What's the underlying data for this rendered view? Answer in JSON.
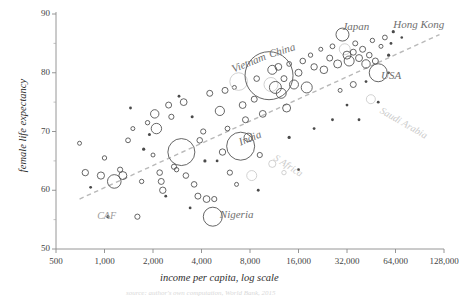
{
  "chart_data": {
    "type": "scatter",
    "title": "",
    "xlabel": "income per capita, log scale",
    "ylabel": "female life expectancy",
    "xticklabels": [
      "500",
      "1,000",
      "2,000",
      "4,000",
      "8,000",
      "16,000",
      "32,000",
      "64,000",
      "128,000"
    ],
    "xtickvalues": [
      500,
      1000,
      2000,
      4000,
      8000,
      16000,
      32000,
      64000,
      128000
    ],
    "yticklabels": [
      "50",
      "60",
      "70",
      "80",
      "90"
    ],
    "ytickvalues": [
      50,
      60,
      70,
      80,
      90
    ],
    "xlim": [
      500,
      128000
    ],
    "ylim": [
      50,
      90
    ],
    "xscale": "log",
    "grid": false,
    "legend": "none",
    "bubble_encoding": "bubble area encodes population; bubble radius varies",
    "trendline": {
      "style": "dashed",
      "color": "#b9b9b9",
      "x_start": 700,
      "y_start": 58.5,
      "x_end": 120000,
      "y_end": 86.5
    },
    "annotations": [
      {
        "label": "Vietnam",
        "x": 6200,
        "y": 80.5,
        "rotation": -22
      },
      {
        "label": "China",
        "x": 10500,
        "y": 83.0,
        "rotation": -17
      },
      {
        "label": "Japan",
        "x": 30000,
        "y": 87.8,
        "rotation": 0
      },
      {
        "label": "Hong Kong",
        "x": 62000,
        "y": 88.2,
        "rotation": 0
      },
      {
        "label": "USA",
        "x": 52000,
        "y": 79.5,
        "rotation": 0
      },
      {
        "label": "Saudi Arabia",
        "x": 52000,
        "y": 73.5,
        "rotation": 30
      },
      {
        "label": "India",
        "x": 6800,
        "y": 68.0,
        "rotation": -22
      },
      {
        "label": "S Africa",
        "x": 11500,
        "y": 65.5,
        "rotation": 33
      },
      {
        "label": "Nigeria",
        "x": 5200,
        "y": 55.8,
        "rotation": 0
      },
      {
        "label": "CAF",
        "x": 900,
        "y": 55.5,
        "rotation": 0
      }
    ],
    "points": [
      {
        "x": 760,
        "y": 63.0,
        "r": 3.2,
        "c": "dark"
      },
      {
        "x": 700,
        "y": 68.0,
        "r": 2.0,
        "c": "dark"
      },
      {
        "x": 820,
        "y": 60.5,
        "r": 1.4,
        "c": "dark"
      },
      {
        "x": 950,
        "y": 62.5,
        "r": 3.6,
        "c": "dark"
      },
      {
        "x": 1000,
        "y": 65.5,
        "r": 2.2,
        "c": "dark"
      },
      {
        "x": 1050,
        "y": 55.5,
        "r": 1.6,
        "c": "dark"
      },
      {
        "x": 1150,
        "y": 61.5,
        "r": 6.8,
        "c": "dark"
      },
      {
        "x": 1300,
        "y": 62.5,
        "r": 4.0,
        "c": "dark"
      },
      {
        "x": 1250,
        "y": 63.5,
        "r": 2.6,
        "c": "dark"
      },
      {
        "x": 1400,
        "y": 68.5,
        "r": 2.4,
        "c": "dark"
      },
      {
        "x": 1500,
        "y": 70.5,
        "r": 2.0,
        "c": "dark"
      },
      {
        "x": 1600,
        "y": 55.5,
        "r": 2.6,
        "c": "dark"
      },
      {
        "x": 1700,
        "y": 61.5,
        "r": 2.2,
        "c": "dark"
      },
      {
        "x": 1750,
        "y": 67.0,
        "r": 1.6,
        "c": "dark"
      },
      {
        "x": 1850,
        "y": 71.5,
        "r": 2.2,
        "c": "dark"
      },
      {
        "x": 1900,
        "y": 69.5,
        "r": 1.5,
        "c": "dark"
      },
      {
        "x": 2050,
        "y": 73.0,
        "r": 4.2,
        "c": "dark"
      },
      {
        "x": 2100,
        "y": 70.5,
        "r": 5.2,
        "c": "dark"
      },
      {
        "x": 2200,
        "y": 63.0,
        "r": 2.8,
        "c": "dark"
      },
      {
        "x": 2250,
        "y": 61.5,
        "r": 3.0,
        "c": "dark"
      },
      {
        "x": 2300,
        "y": 60.0,
        "r": 3.2,
        "c": "dark"
      },
      {
        "x": 2400,
        "y": 59.0,
        "r": 1.4,
        "c": "dark"
      },
      {
        "x": 2500,
        "y": 74.5,
        "r": 3.0,
        "c": "dark"
      },
      {
        "x": 2600,
        "y": 72.5,
        "r": 2.6,
        "c": "dark"
      },
      {
        "x": 2700,
        "y": 64.0,
        "r": 2.6,
        "c": "dark"
      },
      {
        "x": 2800,
        "y": 63.5,
        "r": 2.2,
        "c": "dark"
      },
      {
        "x": 3000,
        "y": 66.5,
        "r": 13.5,
        "c": "dark"
      },
      {
        "x": 3100,
        "y": 75.0,
        "r": 3.4,
        "c": "dark"
      },
      {
        "x": 3200,
        "y": 62.5,
        "r": 2.8,
        "c": "dark"
      },
      {
        "x": 3400,
        "y": 57.0,
        "r": 1.4,
        "c": "dark"
      },
      {
        "x": 3600,
        "y": 61.0,
        "r": 2.8,
        "c": "dark"
      },
      {
        "x": 3800,
        "y": 59.0,
        "r": 3.0,
        "c": "dark"
      },
      {
        "x": 3900,
        "y": 68.5,
        "r": 2.8,
        "c": "dark"
      },
      {
        "x": 4100,
        "y": 70.0,
        "r": 2.6,
        "c": "dark"
      },
      {
        "x": 4300,
        "y": 58.5,
        "r": 3.4,
        "c": "dark"
      },
      {
        "x": 4500,
        "y": 76.5,
        "r": 3.0,
        "c": "dark"
      },
      {
        "x": 4700,
        "y": 55.5,
        "r": 9.5,
        "c": "dark"
      },
      {
        "x": 4800,
        "y": 58.5,
        "r": 2.6,
        "c": "dark"
      },
      {
        "x": 5200,
        "y": 73.5,
        "r": 4.6,
        "c": "dark"
      },
      {
        "x": 5400,
        "y": 66.5,
        "r": 3.2,
        "c": "dark"
      },
      {
        "x": 5600,
        "y": 77.0,
        "r": 3.0,
        "c": "dark"
      },
      {
        "x": 5800,
        "y": 70.5,
        "r": 2.4,
        "c": "dark"
      },
      {
        "x": 6000,
        "y": 63.0,
        "r": 2.6,
        "c": "dark"
      },
      {
        "x": 6400,
        "y": 77.5,
        "r": 2.0,
        "c": "dark"
      },
      {
        "x": 6800,
        "y": 78.5,
        "r": 8.8,
        "c": "light"
      },
      {
        "x": 7000,
        "y": 67.5,
        "r": 14.0,
        "c": "dark"
      },
      {
        "x": 7200,
        "y": 74.5,
        "r": 3.4,
        "c": "dark"
      },
      {
        "x": 7500,
        "y": 72.0,
        "r": 3.0,
        "c": "dark"
      },
      {
        "x": 7800,
        "y": 69.0,
        "r": 4.2,
        "c": "dark"
      },
      {
        "x": 8200,
        "y": 62.5,
        "r": 5.0,
        "c": "light"
      },
      {
        "x": 8500,
        "y": 75.5,
        "r": 3.0,
        "c": "dark"
      },
      {
        "x": 8800,
        "y": 79.0,
        "r": 2.8,
        "c": "dark"
      },
      {
        "x": 9200,
        "y": 66.0,
        "r": 2.6,
        "c": "dark"
      },
      {
        "x": 9600,
        "y": 73.0,
        "r": 3.4,
        "c": "dark"
      },
      {
        "x": 10500,
        "y": 79.5,
        "r": 24.0,
        "c": "dark"
      },
      {
        "x": 10800,
        "y": 78.0,
        "r": 7.0,
        "c": "light"
      },
      {
        "x": 11000,
        "y": 80.5,
        "r": 4.5,
        "c": "dark"
      },
      {
        "x": 11500,
        "y": 77.5,
        "r": 6.0,
        "c": "dark"
      },
      {
        "x": 12000,
        "y": 81.0,
        "r": 3.4,
        "c": "dark"
      },
      {
        "x": 12500,
        "y": 76.5,
        "r": 5.0,
        "c": "dark"
      },
      {
        "x": 13000,
        "y": 79.0,
        "r": 3.0,
        "c": "dark"
      },
      {
        "x": 13500,
        "y": 74.0,
        "r": 4.0,
        "c": "dark"
      },
      {
        "x": 14000,
        "y": 81.5,
        "r": 2.4,
        "c": "dark"
      },
      {
        "x": 15000,
        "y": 78.0,
        "r": 4.5,
        "c": "dark"
      },
      {
        "x": 16000,
        "y": 80.0,
        "r": 3.5,
        "c": "dark"
      },
      {
        "x": 17000,
        "y": 82.0,
        "r": 2.8,
        "c": "dark"
      },
      {
        "x": 18000,
        "y": 77.5,
        "r": 5.5,
        "c": "dark"
      },
      {
        "x": 19000,
        "y": 83.0,
        "r": 2.2,
        "c": "dark"
      },
      {
        "x": 20000,
        "y": 81.0,
        "r": 3.2,
        "c": "dark"
      },
      {
        "x": 22000,
        "y": 84.0,
        "r": 2.0,
        "c": "dark"
      },
      {
        "x": 23000,
        "y": 80.5,
        "r": 3.8,
        "c": "dark"
      },
      {
        "x": 25000,
        "y": 82.5,
        "r": 3.0,
        "c": "dark"
      },
      {
        "x": 26000,
        "y": 84.5,
        "r": 2.4,
        "c": "dark"
      },
      {
        "x": 28000,
        "y": 81.5,
        "r": 4.0,
        "c": "dark"
      },
      {
        "x": 30000,
        "y": 86.5,
        "r": 6.5,
        "c": "dark"
      },
      {
        "x": 31000,
        "y": 84.0,
        "r": 5.5,
        "c": "light"
      },
      {
        "x": 32000,
        "y": 83.0,
        "r": 4.0,
        "c": "dark"
      },
      {
        "x": 33000,
        "y": 82.0,
        "r": 5.0,
        "c": "dark"
      },
      {
        "x": 35000,
        "y": 83.5,
        "r": 3.0,
        "c": "dark"
      },
      {
        "x": 36000,
        "y": 85.0,
        "r": 2.5,
        "c": "dark"
      },
      {
        "x": 38000,
        "y": 82.5,
        "r": 3.5,
        "c": "dark"
      },
      {
        "x": 40000,
        "y": 84.0,
        "r": 3.0,
        "c": "dark"
      },
      {
        "x": 42000,
        "y": 81.5,
        "r": 4.2,
        "c": "dark"
      },
      {
        "x": 44000,
        "y": 83.0,
        "r": 2.8,
        "c": "dark"
      },
      {
        "x": 46000,
        "y": 85.5,
        "r": 2.2,
        "c": "dark"
      },
      {
        "x": 48000,
        "y": 82.0,
        "r": 3.0,
        "c": "dark"
      },
      {
        "x": 50000,
        "y": 80.0,
        "r": 9.0,
        "c": "dark"
      },
      {
        "x": 52000,
        "y": 84.5,
        "r": 2.0,
        "c": "dark"
      },
      {
        "x": 55000,
        "y": 86.0,
        "r": 2.4,
        "c": "dark"
      },
      {
        "x": 58000,
        "y": 83.0,
        "r": 1.6,
        "c": "dark"
      },
      {
        "x": 60000,
        "y": 85.0,
        "r": 1.4,
        "c": "dark"
      },
      {
        "x": 45000,
        "y": 75.5,
        "r": 4.5,
        "c": "light"
      },
      {
        "x": 50000,
        "y": 75.0,
        "r": 1.4,
        "c": "dark"
      },
      {
        "x": 42000,
        "y": 78.5,
        "r": 1.4,
        "c": "dark"
      },
      {
        "x": 38000,
        "y": 72.0,
        "r": 1.4,
        "c": "dark"
      },
      {
        "x": 32000,
        "y": 74.5,
        "r": 1.4,
        "c": "dark"
      },
      {
        "x": 26000,
        "y": 72.0,
        "r": 1.4,
        "c": "dark"
      },
      {
        "x": 20000,
        "y": 70.5,
        "r": 1.4,
        "c": "dark"
      },
      {
        "x": 16000,
        "y": 63.5,
        "r": 1.4,
        "c": "dark"
      },
      {
        "x": 14000,
        "y": 69.0,
        "r": 1.6,
        "c": "dark"
      },
      {
        "x": 13000,
        "y": 63.0,
        "r": 2.2,
        "c": "light"
      },
      {
        "x": 11000,
        "y": 64.5,
        "r": 3.6,
        "c": "light"
      },
      {
        "x": 9000,
        "y": 60.0,
        "r": 1.4,
        "c": "dark"
      },
      {
        "x": 6600,
        "y": 61.0,
        "r": 2.0,
        "c": "dark"
      },
      {
        "x": 5000,
        "y": 65.0,
        "r": 1.4,
        "c": "dark"
      },
      {
        "x": 4200,
        "y": 65.0,
        "r": 1.6,
        "c": "dark"
      },
      {
        "x": 3500,
        "y": 72.5,
        "r": 1.5,
        "c": "dark"
      },
      {
        "x": 2900,
        "y": 76.0,
        "r": 1.4,
        "c": "dark"
      },
      {
        "x": 2000,
        "y": 66.0,
        "r": 2.0,
        "c": "dark"
      },
      {
        "x": 1450,
        "y": 74.0,
        "r": 1.4,
        "c": "dark"
      },
      {
        "x": 62000,
        "y": 87.0,
        "r": 1.6,
        "c": "dark"
      },
      {
        "x": 70000,
        "y": 86.0,
        "r": 1.3,
        "c": "dark"
      },
      {
        "x": 58000,
        "y": 80.0,
        "r": 1.3,
        "c": "dark"
      },
      {
        "x": 35000,
        "y": 78.0,
        "r": 3.0,
        "c": "dark"
      },
      {
        "x": 29000,
        "y": 77.0,
        "r": 2.0,
        "c": "dark"
      }
    ]
  },
  "axes": {
    "x_title": "income per capita, log scale",
    "y_title": "female life expectancy"
  },
  "caption": {
    "text": "source: author's own computation, World Bank, 2015"
  }
}
